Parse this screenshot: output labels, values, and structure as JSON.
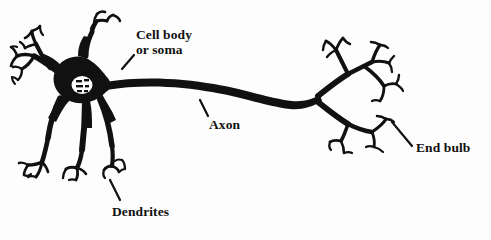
{
  "figure": {
    "background_color": "#fdfdfd",
    "ink_color": "#111111",
    "width": 491,
    "height": 240
  },
  "labels": {
    "cell_body_line1": "Cell body",
    "cell_body_line2": "or soma",
    "axon": "Axon",
    "end_bulb": "End bulb",
    "dendrites": "Dendrites"
  },
  "parts": [
    {
      "name": "soma",
      "label": "Cell body or soma"
    },
    {
      "name": "nucleus",
      "label": "nucleus"
    },
    {
      "name": "dendrites",
      "label": "Dendrites"
    },
    {
      "name": "axon",
      "label": "Axon"
    },
    {
      "name": "axon-terminals",
      "label": "End bulb"
    }
  ]
}
